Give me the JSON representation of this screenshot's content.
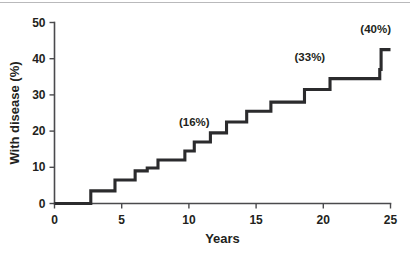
{
  "figure": {
    "background_color": "#ffffff",
    "line_color": "#2b2b2d",
    "axis_color": "#4a4a4d",
    "text_color": "#231f20"
  },
  "chart_data": {
    "type": "line",
    "subtype": "step-post",
    "title": "",
    "subtitle": "",
    "xlabel": "Years",
    "ylabel": "With disease (%)",
    "xlim": [
      0,
      25
    ],
    "ylim": [
      0,
      50
    ],
    "xticks": [
      0,
      5,
      10,
      15,
      20,
      25
    ],
    "yticks": [
      0,
      10,
      20,
      30,
      40,
      50
    ],
    "xtick_labels": [
      "0",
      "5",
      "10",
      "15",
      "20",
      "25"
    ],
    "ytick_labels": [
      "0",
      "10",
      "20",
      "30",
      "40",
      "50"
    ],
    "grid": false,
    "legend": false,
    "legend_position": "none",
    "series": [
      {
        "name": "Cumulative incidence of disease",
        "x": [
          0,
          2.7,
          4.5,
          6.0,
          6.9,
          7.7,
          9.7,
          10.4,
          11.6,
          12.8,
          14.3,
          16.1,
          18.6,
          20.5,
          24.2,
          24.3,
          25.0
        ],
        "y": [
          0,
          3.5,
          6.5,
          9.0,
          9.8,
          12.0,
          14.5,
          17.0,
          19.5,
          22.5,
          25.5,
          28.0,
          31.5,
          34.5,
          37.0,
          42.5,
          42.5
        ]
      }
    ],
    "annotations": [
      {
        "text": "(16%)",
        "x": 10.4,
        "y": 21.5
      },
      {
        "text": "(33%)",
        "x": 19.0,
        "y": 39.5
      },
      {
        "text": "(40%)",
        "x": 23.9,
        "y": 47.0
      }
    ]
  },
  "axes": {
    "x_axis_name": "Years",
    "y_axis_name": "With disease (%)"
  }
}
